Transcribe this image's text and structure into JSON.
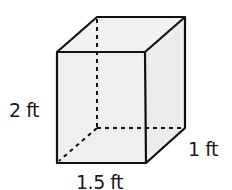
{
  "figure": {
    "type": "rectangular-prism",
    "labels": {
      "height": "2 ft",
      "depth": "1 ft",
      "width": "1.5 ft"
    },
    "colors": {
      "fill": "#efefef",
      "stroke": "#111111"
    }
  }
}
